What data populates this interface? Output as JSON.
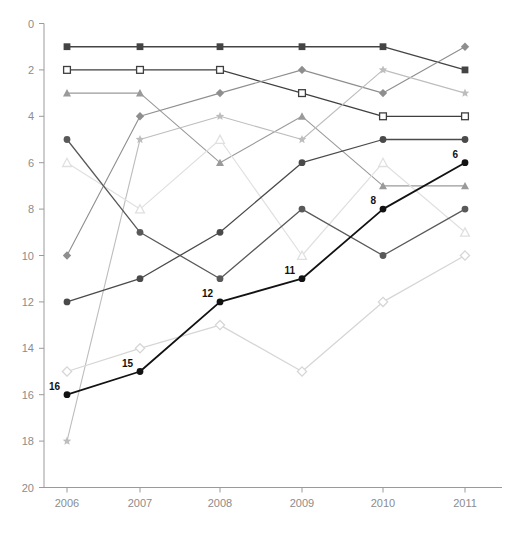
{
  "chart_data": {
    "type": "line",
    "title": "",
    "subtitle": "",
    "xlabel": "",
    "ylabel": "",
    "categories": [
      "2006",
      "2007",
      "2008",
      "2009",
      "2010",
      "2011"
    ],
    "x": [
      2006,
      2007,
      2008,
      2009,
      2010,
      2011
    ],
    "xlim": [
      2005.6,
      2011.4
    ],
    "ylim": [
      0,
      20
    ],
    "y_inverted": true,
    "y_ticks": [
      0,
      2,
      4,
      6,
      8,
      10,
      12,
      14,
      16,
      18,
      20
    ],
    "x_ticks": [
      "2006",
      "2007",
      "2008",
      "2009",
      "2010",
      "2011"
    ],
    "grid": false,
    "legend": "none",
    "note": "Rank chart, lower value = better rank, y axis inverted",
    "series": [
      {
        "name": "series-filled-square-dark",
        "marker": "filled-square",
        "color": "#444444",
        "linewidth": 1.4,
        "values": [
          1,
          1,
          1,
          1,
          1,
          2
        ],
        "labels": [
          null,
          null,
          null,
          null,
          null,
          null
        ]
      },
      {
        "name": "series-open-square",
        "marker": "open-square",
        "color": "#3f3f3f",
        "linewidth": 1.2,
        "values": [
          2,
          2,
          2,
          3,
          4,
          4
        ],
        "labels": [
          null,
          null,
          null,
          null,
          null,
          null
        ]
      },
      {
        "name": "series-triangle-mid",
        "marker": "filled-triangle",
        "color": "#9a9a9a",
        "linewidth": 1.1,
        "values": [
          3,
          3,
          6,
          4,
          7,
          7
        ],
        "labels": [
          null,
          null,
          null,
          null,
          null,
          null
        ]
      },
      {
        "name": "series-diamond-mid",
        "marker": "filled-diamond",
        "color": "#8e8e8e",
        "linewidth": 1.1,
        "values": [
          10,
          4,
          3,
          2,
          3,
          1
        ],
        "labels": [
          null,
          null,
          null,
          null,
          null,
          null
        ]
      },
      {
        "name": "series-star-light",
        "marker": "star",
        "color": "#bdbdbd",
        "linewidth": 1.1,
        "values": [
          18,
          5,
          4,
          5,
          2,
          3
        ],
        "labels": [
          null,
          null,
          null,
          null,
          null,
          null
        ]
      },
      {
        "name": "series-open-triangle-pale",
        "marker": "open-triangle",
        "color": "#e0e0e0",
        "linewidth": 1.2,
        "values": [
          6,
          8,
          5,
          10,
          6,
          9
        ],
        "labels": [
          null,
          null,
          null,
          null,
          null,
          null
        ]
      },
      {
        "name": "series-circle-dark-descending",
        "marker": "filled-circle",
        "color": "#595959",
        "linewidth": 1.3,
        "values": [
          5,
          9,
          11,
          8,
          10,
          8
        ],
        "labels": [
          null,
          null,
          null,
          null,
          null,
          null
        ]
      },
      {
        "name": "series-circle-mid-rising",
        "marker": "filled-circle",
        "color": "#4a4a4a",
        "linewidth": 1.3,
        "values": [
          12,
          11,
          9,
          6,
          5,
          5
        ],
        "labels": [
          null,
          null,
          null,
          null,
          null,
          null
        ]
      },
      {
        "name": "series-open-diamond-pale",
        "marker": "open-diamond",
        "color": "#d6d6d6",
        "linewidth": 1.3,
        "values": [
          15,
          14,
          13,
          15,
          12,
          10
        ],
        "labels": [
          null,
          null,
          null,
          null,
          null,
          null
        ]
      },
      {
        "name": "series-highlight-black",
        "marker": "filled-circle",
        "color": "#121212",
        "linewidth": 1.8,
        "values": [
          16,
          15,
          12,
          11,
          8,
          6
        ],
        "labels": [
          "16",
          "15",
          "12",
          "11",
          "8",
          "6"
        ]
      }
    ]
  },
  "axes": {
    "y_tick_labels": [
      "0",
      "2",
      "4",
      "6",
      "8",
      "10",
      "12",
      "14",
      "16",
      "18",
      "20"
    ],
    "x_tick_labels": [
      "2006",
      "2007",
      "2008",
      "2009",
      "2010",
      "2011"
    ]
  },
  "footnote": {
    "text": ""
  }
}
